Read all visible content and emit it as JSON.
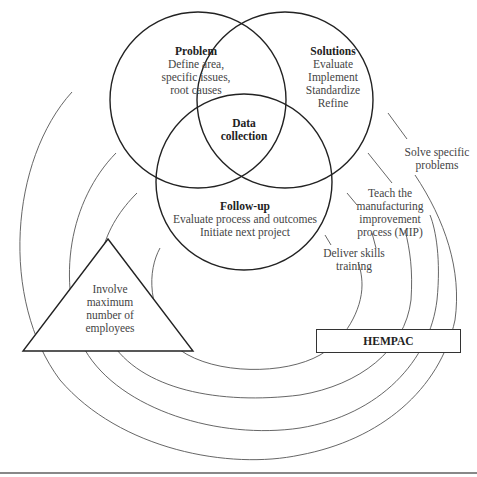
{
  "diagram": {
    "venn": {
      "problem": {
        "title": "Problem",
        "lines": [
          "Define area,",
          "specific issues,",
          "root causes"
        ]
      },
      "solutions": {
        "title": "Solutions",
        "lines": [
          "Evaluate",
          "Implement",
          "Standardize",
          "Refine"
        ]
      },
      "center": {
        "lines": [
          "Data",
          "collection"
        ]
      },
      "followup": {
        "title": "Follow-up",
        "lines": [
          "Evaluate process and outcomes",
          "Initiate next project"
        ]
      }
    },
    "triangle": {
      "lines": [
        "Involve",
        "maximum",
        "number of",
        "employees"
      ]
    },
    "hempac": {
      "label": "HEMPAC"
    },
    "arc_labels": [
      {
        "lines": [
          "Solve specific",
          "problems"
        ]
      },
      {
        "lines": [
          "Teach the",
          "manufacturing",
          "improvement",
          "process (MIP)"
        ]
      },
      {
        "lines": [
          "Deliver skills",
          "training"
        ]
      }
    ],
    "colors": {
      "stroke": "#222222",
      "arc": "#555555",
      "text": "#444444"
    }
  }
}
